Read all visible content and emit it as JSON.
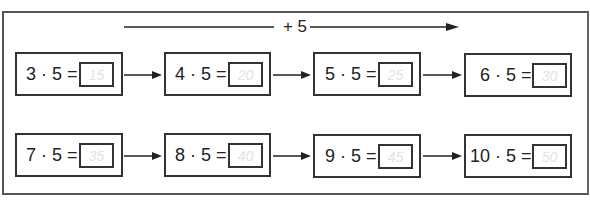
{
  "header": {
    "operation_label": "+ 5"
  },
  "rows": [
    [
      {
        "expression": "3 · 5 =",
        "answer": "15"
      },
      {
        "expression": "4 · 5 =",
        "answer": "20"
      },
      {
        "expression": "5 · 5 =",
        "answer": "25"
      },
      {
        "expression": "6 · 5 =",
        "answer": "30"
      }
    ],
    [
      {
        "expression": "7 · 5 =",
        "answer": "35"
      },
      {
        "expression": "8 · 5 =",
        "answer": "40"
      },
      {
        "expression": "9 · 5 =",
        "answer": "45"
      },
      {
        "expression": "10 · 5 =",
        "answer": "50"
      }
    ]
  ],
  "colors": {
    "border": "#333333",
    "answer_text": "#e3e3e3",
    "frame": "#555555"
  }
}
